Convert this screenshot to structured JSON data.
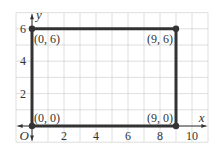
{
  "chart_data": {
    "type": "scatter",
    "title": "",
    "xlabel": "x",
    "ylabel": "y",
    "origin_label": "O",
    "xlim": [
      -1,
      11
    ],
    "ylim": [
      -1,
      7
    ],
    "grid": true,
    "x_ticks": [
      2,
      4,
      6,
      8,
      10
    ],
    "y_ticks": [
      2,
      4,
      6
    ],
    "points": [
      {
        "x": 0,
        "y": 6,
        "label": "(0, 6)"
      },
      {
        "x": 9,
        "y": 6,
        "label": "(9, 6)"
      },
      {
        "x": 0,
        "y": 0,
        "label": "(0, 0)"
      },
      {
        "x": 9,
        "y": 0,
        "label": "(9, 0)"
      }
    ],
    "polygon": {
      "vertices": [
        [
          0,
          0
        ],
        [
          0,
          6
        ],
        [
          9,
          6
        ],
        [
          9,
          0
        ]
      ],
      "closed": true,
      "description": "rectangle"
    }
  },
  "colors": {
    "grid": "#d6d6d6",
    "shape": "#333333",
    "text": "#333333",
    "background": "#ffffff"
  }
}
